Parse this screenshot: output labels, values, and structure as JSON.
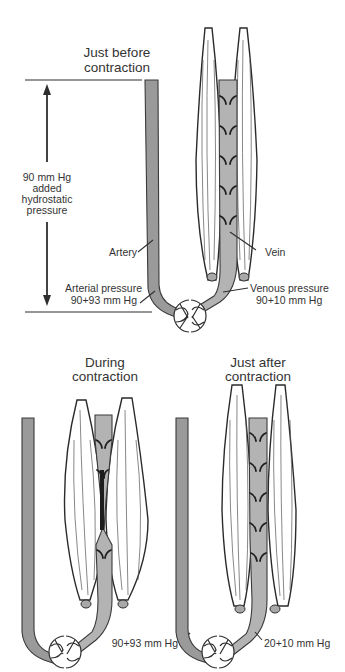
{
  "figure": {
    "colors": {
      "vessel_fill": "#9a9a9a",
      "vein_fill": "#b3b3b3",
      "outline": "#2e2e2e",
      "text": "#333333",
      "background": "#ffffff"
    },
    "panels": [
      {
        "id": "before",
        "title_line1": "Just before",
        "title_line2": "contraction",
        "labels": {
          "artery": "Artery",
          "vein": "Vein",
          "arterial_pressure_line1": "Arterial pressure",
          "arterial_pressure_line2": "90+93 mm Hg",
          "venous_pressure_line1": "Venous pressure",
          "venous_pressure_line2": "90+10 mm Hg"
        },
        "hydrostatic": {
          "line1": "90 mm Hg",
          "line2": "added",
          "line3": "hydrostatic",
          "line4": "pressure"
        }
      },
      {
        "id": "during",
        "title_line1": "During",
        "title_line2": "contraction",
        "labels": {
          "arterial_pressure": "90+93 mm Hg"
        }
      },
      {
        "id": "after",
        "title_line1": "Just after",
        "title_line2": "contraction",
        "labels": {
          "venous_pressure": "20+10 mm Hg"
        }
      }
    ]
  }
}
